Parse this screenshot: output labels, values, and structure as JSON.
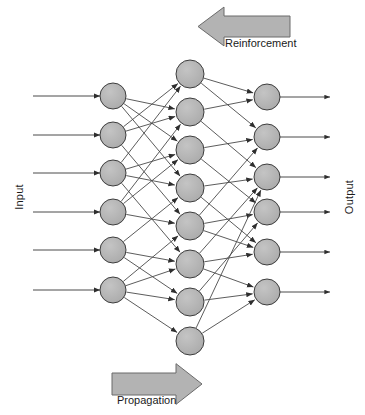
{
  "diagram": {
    "type": "neural-network",
    "labels": {
      "input": "Input",
      "output": "Output",
      "reinforcement": "Reinforcement",
      "propagation": "Propagation"
    },
    "colors": {
      "node_fill": "#b3b3b3",
      "node_stroke": "#3d3d3d",
      "edge": "#4a4a4a",
      "arrow_fill": "#b3b3b3",
      "arrow_stroke": "#6b6b6b",
      "text": "#1a1a1a",
      "background": "#ffffff"
    },
    "layers": [
      {
        "name": "input-layer",
        "count": 6,
        "node_radius": 13,
        "x": 113,
        "node_y": [
          96,
          135,
          173,
          212,
          250,
          290
        ]
      },
      {
        "name": "hidden-layer",
        "count": 8,
        "node_radius": 14,
        "x": 190,
        "node_y": [
          74,
          112,
          150,
          188,
          226,
          264,
          302,
          341
        ]
      },
      {
        "name": "output-layer",
        "count": 6,
        "node_radius": 13,
        "x": 267,
        "node_y": [
          97,
          137,
          177,
          212,
          252,
          292
        ]
      }
    ],
    "input_arrows": {
      "name": "input-signal-arrows",
      "count": 6,
      "x_start": 33,
      "x_end": 100,
      "y": [
        96,
        135,
        173,
        212,
        250,
        290
      ]
    },
    "output_arrows": {
      "name": "output-signal-arrows",
      "count": 6,
      "x_start": 280,
      "x_end": 330,
      "y": [
        97,
        137,
        177,
        212,
        252,
        292
      ]
    },
    "block_arrows": [
      {
        "name": "reinforcement-arrow",
        "direction": "left",
        "x": 198,
        "y": 16,
        "width": 92,
        "height": 21,
        "head_width": 26
      },
      {
        "name": "propagation-arrow",
        "direction": "right",
        "x": 112,
        "y": 373,
        "width": 90,
        "height": 22,
        "head_width": 26
      }
    ],
    "edges": [
      {
        "from_layer": 0,
        "from": 0,
        "to_layer": 1,
        "to": 1
      },
      {
        "from_layer": 0,
        "from": 0,
        "to_layer": 1,
        "to": 2
      },
      {
        "from_layer": 0,
        "from": 0,
        "to_layer": 1,
        "to": 3
      },
      {
        "from_layer": 0,
        "from": 1,
        "to_layer": 1,
        "to": 0
      },
      {
        "from_layer": 0,
        "from": 1,
        "to_layer": 1,
        "to": 1
      },
      {
        "from_layer": 0,
        "from": 1,
        "to_layer": 1,
        "to": 4
      },
      {
        "from_layer": 0,
        "from": 2,
        "to_layer": 1,
        "to": 0
      },
      {
        "from_layer": 0,
        "from": 2,
        "to_layer": 1,
        "to": 2
      },
      {
        "from_layer": 0,
        "from": 2,
        "to_layer": 1,
        "to": 3
      },
      {
        "from_layer": 0,
        "from": 2,
        "to_layer": 1,
        "to": 5
      },
      {
        "from_layer": 0,
        "from": 3,
        "to_layer": 1,
        "to": 1
      },
      {
        "from_layer": 0,
        "from": 3,
        "to_layer": 1,
        "to": 2
      },
      {
        "from_layer": 0,
        "from": 3,
        "to_layer": 1,
        "to": 4
      },
      {
        "from_layer": 0,
        "from": 4,
        "to_layer": 1,
        "to": 3
      },
      {
        "from_layer": 0,
        "from": 4,
        "to_layer": 1,
        "to": 5
      },
      {
        "from_layer": 0,
        "from": 4,
        "to_layer": 1,
        "to": 6
      },
      {
        "from_layer": 0,
        "from": 5,
        "to_layer": 1,
        "to": 4
      },
      {
        "from_layer": 0,
        "from": 5,
        "to_layer": 1,
        "to": 5
      },
      {
        "from_layer": 0,
        "from": 5,
        "to_layer": 1,
        "to": 6
      },
      {
        "from_layer": 0,
        "from": 5,
        "to_layer": 1,
        "to": 7
      },
      {
        "from_layer": 1,
        "from": 0,
        "to_layer": 2,
        "to": 0
      },
      {
        "from_layer": 1,
        "from": 0,
        "to_layer": 2,
        "to": 1
      },
      {
        "from_layer": 1,
        "from": 1,
        "to_layer": 2,
        "to": 0
      },
      {
        "from_layer": 1,
        "from": 1,
        "to_layer": 2,
        "to": 2
      },
      {
        "from_layer": 1,
        "from": 2,
        "to_layer": 2,
        "to": 1
      },
      {
        "from_layer": 1,
        "from": 2,
        "to_layer": 2,
        "to": 3
      },
      {
        "from_layer": 1,
        "from": 3,
        "to_layer": 2,
        "to": 2
      },
      {
        "from_layer": 1,
        "from": 3,
        "to_layer": 2,
        "to": 4
      },
      {
        "from_layer": 1,
        "from": 4,
        "to_layer": 2,
        "to": 1
      },
      {
        "from_layer": 1,
        "from": 4,
        "to_layer": 2,
        "to": 3
      },
      {
        "from_layer": 1,
        "from": 4,
        "to_layer": 2,
        "to": 4
      },
      {
        "from_layer": 1,
        "from": 5,
        "to_layer": 2,
        "to": 2
      },
      {
        "from_layer": 1,
        "from": 5,
        "to_layer": 2,
        "to": 4
      },
      {
        "from_layer": 1,
        "from": 5,
        "to_layer": 2,
        "to": 5
      },
      {
        "from_layer": 1,
        "from": 6,
        "to_layer": 2,
        "to": 3
      },
      {
        "from_layer": 1,
        "from": 6,
        "to_layer": 2,
        "to": 5
      },
      {
        "from_layer": 1,
        "from": 7,
        "to_layer": 2,
        "to": 2
      },
      {
        "from_layer": 1,
        "from": 7,
        "to_layer": 2,
        "to": 5
      }
    ]
  }
}
